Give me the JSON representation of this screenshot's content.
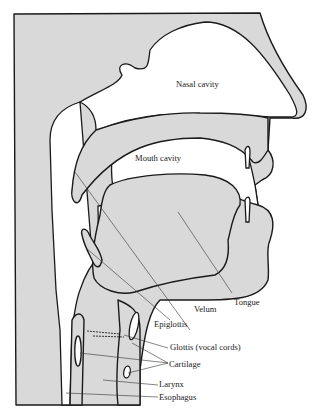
{
  "diagram": {
    "type": "anatomical cross-section",
    "labels": {
      "nasal_cavity": "Nasal cavity",
      "mouth_cavity": "Mouth cavity",
      "velum": "Velum",
      "tongue": "Tongue",
      "epiglottis": "Epiglottis",
      "glottis": "Glottis (vocal cords)",
      "cartilage": "Cartilage",
      "larynx": "Larynx",
      "esophagus": "Esophagus"
    },
    "colors": {
      "tissue": "#d9d9d9",
      "cavity": "#ffffff",
      "outline": "#1a1a1a"
    }
  }
}
